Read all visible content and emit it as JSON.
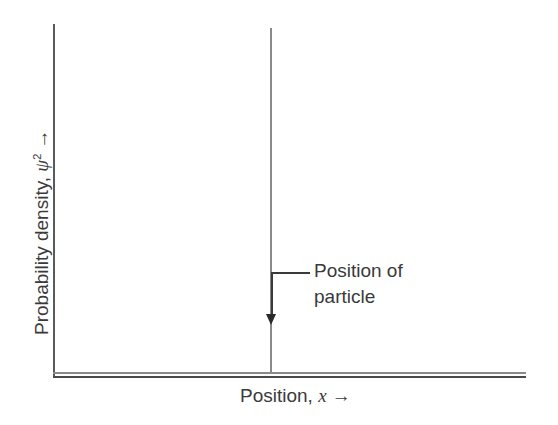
{
  "chart_data": {
    "type": "line",
    "title": "",
    "xlabel": "Position, x →",
    "ylabel": "Probability density, ψ² →",
    "x_axis": {
      "label": "Position",
      "variable": "x",
      "arrow": "→"
    },
    "y_axis": {
      "label": "Probability density",
      "variable": "ψ",
      "superscript": "2",
      "arrow": "→"
    },
    "series": [
      {
        "name": "Probability density of localized particle",
        "description": "Delta-like spike: zero everywhere except a single vertical line at the particle position",
        "x": [
          0,
          0.46,
          0.46,
          0.46,
          1
        ],
        "values": [
          0,
          0,
          1,
          0,
          0
        ]
      }
    ],
    "annotations": [
      {
        "text": "Position of particle",
        "points_to": "spike at x ≈ 0.46 (relative)",
        "arrow": "down"
      }
    ],
    "grid": false,
    "ticks": false,
    "legend": null
  },
  "figure": {
    "annotation": {
      "line1": "Position of",
      "line2": "particle"
    },
    "x_label": {
      "text": "Position, ",
      "var": "x",
      "arrow": " →"
    },
    "y_label": {
      "text": "Probability density, ",
      "var": "ψ",
      "sup": "2",
      "arrow": " →"
    }
  }
}
